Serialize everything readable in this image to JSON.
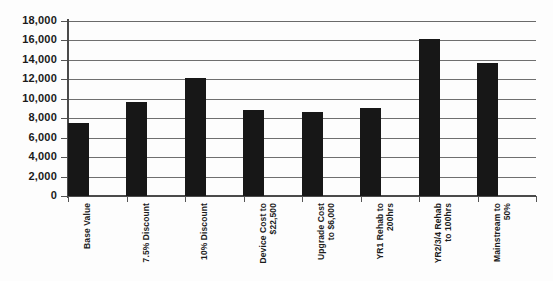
{
  "chart_data": {
    "type": "bar",
    "title": "",
    "subtitle": "",
    "xlabel": "",
    "ylabel": "",
    "ylim": [
      0,
      18000
    ],
    "ytick_values": [
      0,
      2000,
      4000,
      6000,
      8000,
      10000,
      12000,
      14000,
      16000,
      18000
    ],
    "ytick_labels": [
      "0",
      "2,000",
      "4,000",
      "6,000",
      "8,000",
      "10,000",
      "12,000",
      "14,000",
      "16,000",
      "18,000"
    ],
    "grid": true,
    "grid_axis": "y",
    "legend": false,
    "legend_position": "none",
    "bar_color": "#171717",
    "categories": [
      "Base Value",
      "7.5% Discount",
      "10% Discount",
      "Device Cost to\n$22,500",
      "Upgrade Cost\nto $6,000",
      "YR1 Rehab to\n200hrs",
      "YR2/3/4 Rehab\nto 100hrs",
      "Mainstream to\n50%"
    ],
    "values": [
      7500,
      9700,
      12150,
      8800,
      8600,
      9050,
      16100,
      13700
    ],
    "series": [
      {
        "name": "Value",
        "values": [
          7500,
          9700,
          12150,
          8800,
          8600,
          9050,
          16100,
          13700
        ]
      }
    ]
  }
}
